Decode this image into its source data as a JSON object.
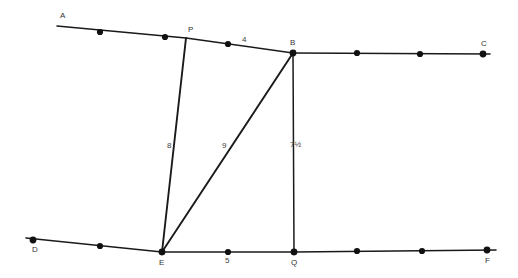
{
  "figure": {
    "width": 518,
    "height": 278,
    "background_color": "#ffffff",
    "stroke_color": "#1a1a1a"
  },
  "vertices": [
    {
      "id": "A",
      "label": "A",
      "x": 57,
      "y": 26,
      "label_x": 60,
      "label_y": 18,
      "has_dot": false
    },
    {
      "id": "P",
      "label": "P",
      "x": 186,
      "y": 38,
      "label_x": 188,
      "label_y": 32,
      "has_dot": false
    },
    {
      "id": "B",
      "label": "B",
      "x": 293,
      "y": 53,
      "label_x": 290,
      "label_y": 45,
      "has_dot": true
    },
    {
      "id": "C",
      "label": "C",
      "x": 483,
      "y": 54,
      "label_x": 481,
      "label_y": 46,
      "has_dot": true
    },
    {
      "id": "D",
      "label": "D",
      "x": 33,
      "y": 240,
      "label_x": 32,
      "label_y": 252,
      "has_dot": true
    },
    {
      "id": "E",
      "label": "E",
      "x": 162,
      "y": 252,
      "label_x": 159,
      "label_y": 265,
      "has_dot": true
    },
    {
      "id": "Q",
      "label": "Q",
      "x": 294,
      "y": 252,
      "label_x": 291,
      "label_y": 265,
      "has_dot": true
    },
    {
      "id": "F",
      "label": "F",
      "x": 487,
      "y": 250,
      "label_x": 485,
      "label_y": 263,
      "has_dot": true
    }
  ],
  "segments": [
    {
      "name": "line-a-to-c",
      "from": "A",
      "to": "C",
      "width": 1.6
    },
    {
      "name": "line-d-to-f",
      "from": "D",
      "to": "F",
      "width": 1.6
    },
    {
      "name": "segment-p-to-e",
      "from": "P",
      "to": "E",
      "width": 1.9,
      "measure": "8"
    },
    {
      "name": "segment-e-to-b",
      "from": "E",
      "to": "B",
      "width": 1.9,
      "measure": "9"
    },
    {
      "name": "segment-b-to-q",
      "from": "B",
      "to": "Q",
      "width": 1.5,
      "measure": "7½"
    }
  ],
  "tick_dots": [
    {
      "name": "tick-a-1",
      "x": 100,
      "y": 32
    },
    {
      "name": "tick-a-2",
      "x": 165,
      "y": 37
    },
    {
      "name": "tick-a-3",
      "x": 228,
      "y": 44
    },
    {
      "name": "tick-bc-1",
      "x": 357,
      "y": 53
    },
    {
      "name": "tick-bc-2",
      "x": 420,
      "y": 54
    },
    {
      "name": "tick-de-1",
      "x": 100,
      "y": 246
    },
    {
      "name": "tick-ef-1",
      "x": 228,
      "y": 252
    },
    {
      "name": "tick-qf-1",
      "x": 357,
      "y": 251
    },
    {
      "name": "tick-qf-2",
      "x": 422,
      "y": 251
    }
  ],
  "measure_labels": [
    {
      "name": "measure-label-top",
      "text": "4",
      "x": 242,
      "y": 42,
      "belongs_to": "segment-p-to-b"
    },
    {
      "name": "measure-label-left",
      "text": "8",
      "x": 167,
      "y": 148,
      "belongs_to": "segment-p-to-e"
    },
    {
      "name": "measure-label-diagonal",
      "text": "9",
      "x": 222,
      "y": 148,
      "belongs_to": "segment-e-to-b"
    },
    {
      "name": "measure-label-right",
      "text": "7½",
      "x": 290,
      "y": 147,
      "belongs_to": "segment-b-to-q"
    },
    {
      "name": "measure-label-bottom",
      "text": "5",
      "x": 225,
      "y": 263,
      "belongs_to": "segment-e-to-q"
    }
  ]
}
